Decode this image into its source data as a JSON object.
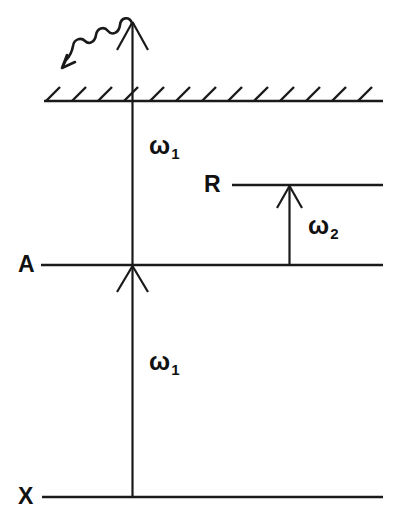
{
  "figure": {
    "type": "energy-level-diagram",
    "width": 400,
    "height": 532,
    "background_color": "#ffffff",
    "stroke_color": "#1a1a1a"
  },
  "labels": {
    "ground_state": "X",
    "intermediate_state": "A",
    "resonant_state": "R",
    "photon_one_upper": "ω",
    "photon_one_upper_sub": "1",
    "photon_one_lower": "ω",
    "photon_one_lower_sub": "1",
    "photon_two": "ω",
    "photon_two_sub": "2"
  },
  "levels": [
    {
      "name": "X",
      "label": "X",
      "y": 497,
      "x_start": 42,
      "x_end": 383,
      "style": "solid",
      "description": "ground state level line"
    },
    {
      "name": "A",
      "label": "A",
      "y": 265,
      "x_start": 41,
      "x_end": 383,
      "style": "solid",
      "description": "intermediate state level line"
    },
    {
      "name": "R",
      "label": "R",
      "y": 185,
      "x_start": 232,
      "x_end": 383,
      "style": "solid",
      "description": "resonant state level line"
    },
    {
      "name": "ionization-continuum",
      "label": "",
      "y": 101,
      "x_start": 44,
      "x_end": 383,
      "style": "hatched",
      "hatch_count": 13,
      "description": "continuum / dissociation limit with hatching above the line"
    }
  ],
  "transitions": [
    {
      "name": "omega-1-lower",
      "label": "ω",
      "sublabel": "1",
      "from_level": "X",
      "to_level": "A",
      "x": 132,
      "y_start": 497,
      "y_end": 266,
      "direction": "up",
      "style": "straight-arrow"
    },
    {
      "name": "omega-1-upper",
      "label": "ω",
      "sublabel": "1",
      "from_level": "A",
      "to_level": "continuum",
      "x": 132,
      "y_start": 265,
      "y_end": 22,
      "direction": "up",
      "style": "straight-arrow"
    },
    {
      "name": "omega-2",
      "label": "ω",
      "sublabel": "2",
      "from_level": "A",
      "to_level": "R",
      "x": 289,
      "y_start": 265,
      "y_end": 186,
      "direction": "up",
      "style": "straight-arrow"
    },
    {
      "name": "photon-emission",
      "label": "",
      "sublabel": "",
      "from_level": "continuum",
      "to_level": "",
      "direction": "down-left",
      "style": "wavy-arrow",
      "description": "squiggly emitted photon arrow pointing down and to the left"
    }
  ]
}
